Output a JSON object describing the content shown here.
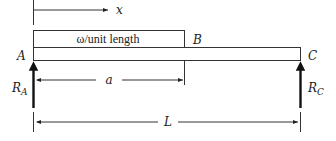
{
  "diagram": {
    "type": "simply-supported beam with partial uniform load",
    "labels": {
      "x_axis": "x",
      "load": "ω/unit length",
      "point_a": "A",
      "point_b": "B",
      "point_c": "C",
      "reaction_a_main": "R",
      "reaction_a_sub": "A",
      "reaction_c_main": "R",
      "reaction_c_sub": "C",
      "dim_a": "a",
      "dim_l": "L"
    },
    "colors": {
      "line": "#222222",
      "background": "#ffffff"
    }
  }
}
